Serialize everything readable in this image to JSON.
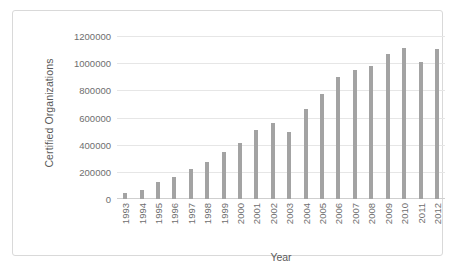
{
  "chart_data": {
    "type": "bar",
    "title": "",
    "xlabel": "Year",
    "ylabel": "Certified Organizations",
    "categories": [
      "1993",
      "1994",
      "1995",
      "1996",
      "1997",
      "1998",
      "1999",
      "2000",
      "2001",
      "2002",
      "2003",
      "2004",
      "2005",
      "2006",
      "2007",
      "2008",
      "2009",
      "2010",
      "2011",
      "2012"
    ],
    "values": [
      46000,
      70000,
      128000,
      163000,
      223000,
      272000,
      343000,
      409000,
      510000,
      561000,
      497000,
      660000,
      776000,
      897000,
      951000,
      982000,
      1064000,
      1111000,
      1009000,
      1101000
    ],
    "ytick_labels": [
      "1200000",
      "1000000",
      "800000",
      "600000",
      "400000",
      "200000",
      "0"
    ],
    "ytick_values": [
      1200000,
      1000000,
      800000,
      600000,
      400000,
      200000,
      0
    ],
    "ylim": [
      0,
      1200000
    ],
    "grid": true,
    "legend": false,
    "bar_color": "#a3a3a3",
    "grid_color": "#e6e6e6",
    "text_color": "#6e6e6e",
    "border_color": "#d9d9d9"
  }
}
